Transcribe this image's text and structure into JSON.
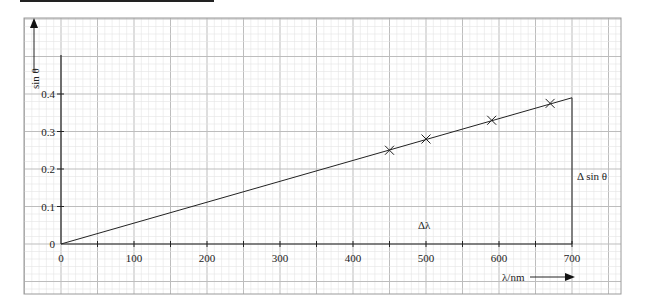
{
  "chart_data": {
    "type": "scatter",
    "title": "",
    "xlabel": "λ/nm",
    "ylabel": "sin θ",
    "xlim": [
      0,
      700
    ],
    "ylim": [
      0,
      0.4
    ],
    "x_ticks": [
      "0",
      "100",
      "200",
      "300",
      "400",
      "500",
      "600",
      "700"
    ],
    "y_ticks": [
      "0",
      "0.1",
      "0.2",
      "0.3",
      "0.4"
    ],
    "grid": true,
    "series": [
      {
        "name": "measurements",
        "marker": "x",
        "x": [
          450,
          500,
          590,
          670
        ],
        "y": [
          0.25,
          0.28,
          0.33,
          0.375
        ]
      },
      {
        "name": "best-fit line",
        "type": "line",
        "x": [
          0,
          700
        ],
        "y": [
          0,
          0.39
        ]
      }
    ],
    "annotations": [
      {
        "text": "Δλ",
        "x": 500,
        "y": 0.06
      },
      {
        "text": "Δ sin θ",
        "x": 745,
        "y": 0.19
      }
    ]
  },
  "labels": {
    "x_axis": "λ/nm",
    "y_axis": "sin θ",
    "delta_lambda": "Δλ",
    "delta_sin": "Δ sin θ"
  },
  "colors": {
    "grid_minor": "#e4e4e4",
    "grid_major": "#bdbdbd",
    "ink": "#222222"
  }
}
